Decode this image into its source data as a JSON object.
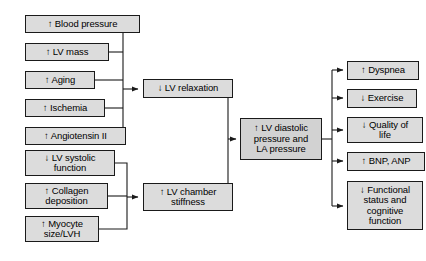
{
  "diagram": {
    "type": "flowchart",
    "orientation": "left-to-right",
    "colors": {
      "node_fill": "#dcdcdc",
      "node_border": "#1a1a1a",
      "connector": "#1a1a1a",
      "background": "#ffffff",
      "text": "#000000"
    },
    "columns": {
      "causes_label": "causes",
      "mechanisms_label": "mechanisms",
      "hemodynamic_label": "hemodynamic consequence",
      "outcomes_label": "clinical outcomes"
    },
    "nodes": {
      "causes": [
        {
          "id": "blood-pressure",
          "text": "↑ Blood pressure",
          "x": 25,
          "y": 15,
          "w": 115,
          "h": 18,
          "target": "lv-relaxation"
        },
        {
          "id": "lv-mass",
          "text": "↑ LV mass",
          "x": 25,
          "y": 43,
          "w": 84,
          "h": 18,
          "target": "lv-relaxation"
        },
        {
          "id": "aging",
          "text": "↑ Aging",
          "x": 25,
          "y": 71,
          "w": 70,
          "h": 18,
          "target": "lv-relaxation"
        },
        {
          "id": "ischemia",
          "text": "↑ Ischemia",
          "x": 25,
          "y": 99,
          "w": 80,
          "h": 18,
          "target": "lv-relaxation"
        },
        {
          "id": "angiotensin-ii",
          "text": "↑ Angiotensin II",
          "x": 25,
          "y": 127,
          "w": 101,
          "h": 18,
          "target": "lv-relaxation"
        },
        {
          "id": "lv-systolic-function",
          "text": "↓ LV systolic\nfunction",
          "x": 25,
          "y": 150,
          "w": 90,
          "h": 26,
          "target": "lv-chamber-stiffness"
        },
        {
          "id": "collagen-deposition",
          "text": "↑ Collagen\ndeposition",
          "x": 25,
          "y": 183,
          "w": 83,
          "h": 26,
          "target": "lv-chamber-stiffness"
        },
        {
          "id": "myocyte-size-lvh",
          "text": "↑ Myocyte\nsize/LVH",
          "x": 25,
          "y": 216,
          "w": 74,
          "h": 26,
          "target": "lv-chamber-stiffness"
        }
      ],
      "mechanisms": [
        {
          "id": "lv-relaxation",
          "text": "↓ LV relaxation",
          "x": 143,
          "y": 79,
          "w": 90,
          "h": 19,
          "target": "lv-diastolic-pressure"
        },
        {
          "id": "lv-chamber-stiffness",
          "text": "↑ LV chamber\nstiffness",
          "x": 143,
          "y": 183,
          "w": 90,
          "h": 28,
          "target": "lv-diastolic-pressure"
        }
      ],
      "hemodynamic": [
        {
          "id": "lv-diastolic-pressure",
          "text": "↑ LV diastolic\npressure and\nLA pressure",
          "x": 240,
          "y": 118,
          "w": 82,
          "h": 42
        }
      ],
      "outcomes": [
        {
          "id": "dyspnea",
          "text": "↑ Dyspnea",
          "x": 347,
          "y": 61,
          "w": 72,
          "h": 19
        },
        {
          "id": "exercise",
          "text": "↓ Exercise",
          "x": 347,
          "y": 89,
          "w": 70,
          "h": 19
        },
        {
          "id": "quality-of-life",
          "text": "↓ Quality of\nlife",
          "x": 347,
          "y": 117,
          "w": 76,
          "h": 26
        },
        {
          "id": "bnp-anp",
          "text": "↑ BNP, ANP",
          "x": 347,
          "y": 152,
          "w": 78,
          "h": 19
        },
        {
          "id": "functional-cognitive",
          "text": "↓ Functional\nstatus and\ncognitive\nfunction",
          "x": 347,
          "y": 181,
          "w": 76,
          "h": 49
        }
      ]
    },
    "connectors": {
      "bus_x_causes_upper": 123,
      "bus_x_causes_lower": 127,
      "bus_x_mechanisms": 228,
      "bus_x_outcomes": 332
    }
  }
}
